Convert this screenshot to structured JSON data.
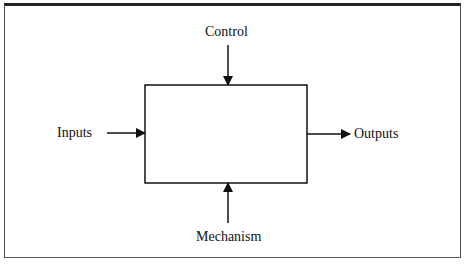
{
  "diagram": {
    "type": "IDEF0 function box",
    "labels": {
      "top": "Control",
      "left": "Inputs",
      "right": "Outputs",
      "bottom": "Mechanism"
    },
    "colors": {
      "stroke": "#111111",
      "frame": "#555555",
      "background": "#ffffff"
    }
  }
}
